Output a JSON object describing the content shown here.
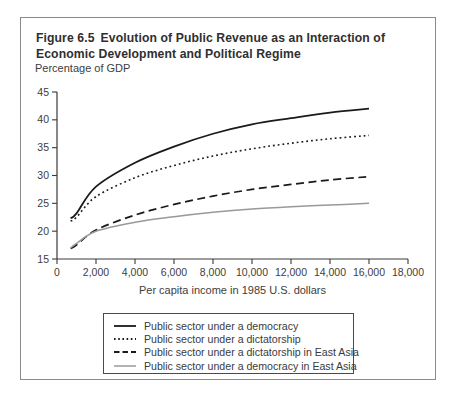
{
  "figure": {
    "number": "Figure 6.5",
    "title": "Evolution of Public Revenue as an Interaction of Economic Development and Political Regime"
  },
  "chart_data": {
    "type": "line",
    "ylabel": "Percentage of GDP",
    "xlabel": "Per capita income in 1985 U.S. dollars",
    "xlim": [
      0,
      18000
    ],
    "ylim": [
      15,
      45
    ],
    "grid": false,
    "legend_position": "bottom boxed",
    "x_ticks": [
      0,
      2000,
      4000,
      6000,
      8000,
      10000,
      12000,
      14000,
      16000,
      18000
    ],
    "x_tick_labels": [
      "0",
      "2,000",
      "4,000",
      "6,000",
      "8,000",
      "10,000",
      "12,000",
      "14,000",
      "16,000",
      "18,000"
    ],
    "y_ticks": [
      15,
      20,
      25,
      30,
      35,
      40,
      45
    ],
    "y_tick_labels": [
      "15",
      "20",
      "25",
      "30",
      "35",
      "40",
      "45"
    ],
    "x": [
      700,
      1000,
      2000,
      4000,
      6000,
      8000,
      10000,
      12000,
      14000,
      16000
    ],
    "series": [
      {
        "name": "Public sector under a democracy",
        "style": "solid",
        "color": "#1a1a1a",
        "values": [
          22.3,
          23.2,
          28.0,
          32.3,
          35.2,
          37.5,
          39.2,
          40.3,
          41.3,
          42.0
        ]
      },
      {
        "name": "Public sector under a dictatorship",
        "style": "dotted",
        "color": "#1a1a1a",
        "values": [
          21.8,
          22.5,
          26.2,
          29.6,
          31.8,
          33.5,
          34.8,
          35.8,
          36.6,
          37.2
        ]
      },
      {
        "name": "Public sector under a dictatorship in East Asia",
        "style": "dashed",
        "color": "#1a1a1a",
        "values": [
          16.9,
          17.5,
          20.2,
          22.9,
          24.8,
          26.3,
          27.5,
          28.4,
          29.2,
          29.8
        ]
      },
      {
        "name": "Public sector under a democracy in East Asia",
        "style": "solid",
        "color": "#999999",
        "values": [
          17.0,
          17.8,
          20.0,
          21.6,
          22.6,
          23.4,
          24.0,
          24.4,
          24.7,
          25.0
        ]
      }
    ],
    "axis_color": "#3a3a3a",
    "border_color": "#8a8a8a"
  }
}
